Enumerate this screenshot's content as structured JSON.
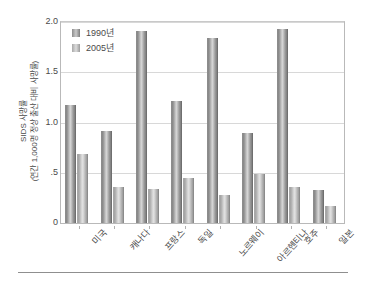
{
  "chart_data": {
    "type": "bar",
    "title": "",
    "xlabel": "",
    "ylabel": "SIDS 사망률 (연간 1,000명 정상 출산 대비 사망률)",
    "ylabel_line1": "SIDS 사망률",
    "ylabel_line2": "(연간 1,000명 정상 출산 대비 사망률)",
    "categories": [
      "미국",
      "캐나다",
      "프랑스",
      "독일",
      "노르웨이",
      "아르헨티나",
      "호주",
      "일본"
    ],
    "series": [
      {
        "name": "1990년",
        "values": [
          1.17,
          0.92,
          1.91,
          1.21,
          1.84,
          0.9,
          1.93,
          0.33
        ]
      },
      {
        "name": "2005년",
        "values": [
          0.69,
          0.36,
          0.34,
          0.45,
          0.28,
          0.49,
          0.36,
          0.17
        ]
      }
    ],
    "ylim": [
      0,
      2.0
    ],
    "ytick_values": [
      0,
      0.5,
      1.0,
      1.5,
      2.0
    ],
    "ytick_labels": [
      "0",
      ".5",
      "1.0",
      "1.5",
      "2.0"
    ],
    "grid": true,
    "legend_position": "top-left",
    "colors": {
      "series_1990": "#8d8d8d",
      "series_2005": "#b4b4b4",
      "gridline": "#d8d8d8",
      "axis": "#b9b9b9",
      "text": "#4a4a4a",
      "background": "#ffffff"
    }
  }
}
